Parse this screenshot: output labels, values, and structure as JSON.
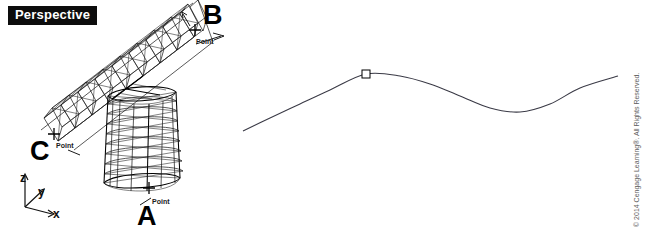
{
  "viewport": {
    "label": "Perspective"
  },
  "callouts": [
    {
      "id": "a",
      "letter": "A",
      "osnap_label": "Point"
    },
    {
      "id": "b",
      "letter": "B",
      "osnap_label": "Point"
    },
    {
      "id": "c",
      "letter": "C",
      "osnap_label": "Point"
    }
  ],
  "axis_tripod": {
    "z_label": "z",
    "y_label": "y",
    "x_label": "x",
    "icon": "axis-tripod-icon"
  },
  "curve_panel": {
    "marker_name": "control-point-marker",
    "curve_name": "interpolated-curve"
  },
  "credit": {
    "text": "© 2014 Cengage Learning®. All Rights Reserved."
  },
  "caption": {
    "text": "FIGURE 6-8   Extruded tube shapes"
  },
  "colors": {
    "background": "#ffffff",
    "wireframe": "#111111",
    "curve": "#3a3a46",
    "label_bar_bg": "#0d0d0d",
    "label_bar_text": "#ffffff",
    "credit_text": "#5e5e5e"
  },
  "chart_data": {
    "type": "line",
    "title": "",
    "xlabel": "",
    "ylabel": "",
    "note": "Free-form interpolated NURBS curve with one visible control point",
    "x": [
      243,
      270,
      300,
      330,
      366,
      400,
      430,
      460,
      490,
      520,
      550,
      580,
      618
    ],
    "y": [
      131,
      118,
      104,
      90,
      74,
      76,
      84,
      96,
      108,
      112,
      104,
      88,
      76
    ],
    "control_points": [
      {
        "x": 366,
        "y": 74
      }
    ],
    "grid": false,
    "legend": "none"
  }
}
